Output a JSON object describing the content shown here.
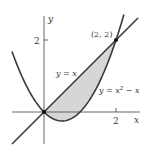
{
  "chart_data": {
    "type": "line",
    "title": "",
    "xlabel": "x",
    "ylabel": "y",
    "x_ticks": [
      {
        "value": 2,
        "label": "2"
      }
    ],
    "y_ticks": [
      {
        "value": 2,
        "label": "2"
      }
    ],
    "series": [
      {
        "name": "y = x",
        "label": "y = x",
        "expression": "x",
        "domain": [
          -0.9,
          2.6
        ]
      },
      {
        "name": "y = x^2 - x",
        "label_parts": [
          "y = x",
          "2",
          " − x"
        ],
        "expression": "x^2 - x",
        "domain": [
          -0.89,
          2.22
        ]
      }
    ],
    "shaded_region": {
      "between": [
        "y = x",
        "y = x^2 - x"
      ],
      "x_range": [
        0,
        2
      ],
      "color": "#d6d6d6"
    },
    "points": [
      {
        "x": 0,
        "y": 0,
        "label": ""
      },
      {
        "x": 2,
        "y": 2,
        "label": "(2, 2)"
      }
    ],
    "colors": {
      "curve": "#3a3a3a",
      "axis": "#555555",
      "fill": "#d6d6d6"
    }
  },
  "labels": {
    "y_axis": "y",
    "x_axis": "x",
    "y_tick_2": "2",
    "x_tick_2": "2",
    "point": "(2, 2)",
    "line": "y = x",
    "parabola_prefix": "y = x",
    "parabola_sup": "2",
    "parabola_suffix": " − x"
  }
}
